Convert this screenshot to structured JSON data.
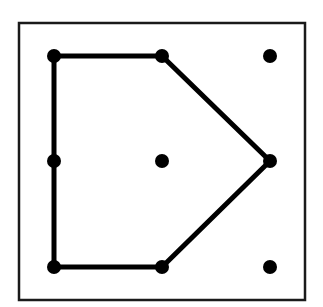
{
  "diagram": {
    "type": "geoboard-polygon",
    "frame": {
      "x": 19,
      "y": 23,
      "width": 286,
      "height": 277,
      "stroke": "#1a1a1a",
      "stroke_width": 2.5
    },
    "grid": {
      "rows": 3,
      "cols": 3,
      "columns_x": [
        54,
        162,
        270
      ],
      "rows_y": [
        56,
        161,
        267
      ]
    },
    "dots": [
      {
        "id": "r0c0",
        "x": 54,
        "y": 56,
        "on_polygon": true
      },
      {
        "id": "r0c1",
        "x": 162,
        "y": 56,
        "on_polygon": true
      },
      {
        "id": "r0c2",
        "x": 270,
        "y": 56,
        "on_polygon": false
      },
      {
        "id": "r1c0",
        "x": 54,
        "y": 161,
        "on_polygon": true
      },
      {
        "id": "r1c1",
        "x": 162,
        "y": 161,
        "on_polygon": false
      },
      {
        "id": "r1c2",
        "x": 270,
        "y": 161,
        "on_polygon": true
      },
      {
        "id": "r2c0",
        "x": 54,
        "y": 267,
        "on_polygon": true
      },
      {
        "id": "r2c1",
        "x": 162,
        "y": 267,
        "on_polygon": true
      },
      {
        "id": "r2c2",
        "x": 270,
        "y": 267,
        "on_polygon": false
      }
    ],
    "polygon": {
      "name": "pentagon",
      "vertices": [
        "r0c0",
        "r0c1",
        "r1c2",
        "r2c1",
        "r2c0"
      ],
      "stroke": "#000000",
      "stroke_width": 5
    },
    "dot_radius": 7,
    "dot_color": "#000000"
  }
}
